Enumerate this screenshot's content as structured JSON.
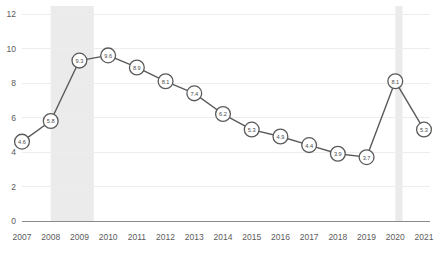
{
  "chart_data": {
    "type": "line",
    "title": "",
    "subtitle": "",
    "xlabel": "",
    "ylabel": "",
    "categories": [
      "2007",
      "2008",
      "2009",
      "2010",
      "2011",
      "2012",
      "2013",
      "2014",
      "2015",
      "2016",
      "2017",
      "2018",
      "2019",
      "2020",
      "2021"
    ],
    "values": [
      4.6,
      5.8,
      9.3,
      9.6,
      8.9,
      8.1,
      7.4,
      6.2,
      5.3,
      4.9,
      4.4,
      3.9,
      3.7,
      8.1,
      5.3
    ],
    "point_labels": [
      "4.6",
      "5.8",
      "9.3",
      "9.6",
      "8.9",
      "8.1",
      "7.4",
      "6.2",
      "5.3",
      "4.9",
      "4.4",
      "3.9",
      "3.7",
      "8.1",
      "5.3"
    ],
    "series": [
      {
        "name": "",
        "values": [
          4.6,
          5.8,
          9.3,
          9.6,
          8.9,
          8.1,
          7.4,
          6.2,
          5.3,
          4.9,
          4.4,
          3.9,
          3.7,
          8.1,
          5.3
        ]
      }
    ],
    "ylim": [
      0,
      12
    ],
    "yticks": [
      0,
      2,
      4,
      6,
      8,
      10,
      12
    ],
    "ytick_labels": [
      "0",
      "2",
      "4",
      "6",
      "8",
      "10",
      "12"
    ],
    "xtick_labels": [
      "2007",
      "2008",
      "2009",
      "2010",
      "2011",
      "2012",
      "2013",
      "2014",
      "2015",
      "2016",
      "2017",
      "2018",
      "2019",
      "2020",
      "2021"
    ],
    "grid": true,
    "grid_axis": "y",
    "legend": false,
    "legend_position": "none",
    "annotations": [
      {
        "name": "recession-band-2008",
        "type": "vspan",
        "x_start": 2008.0,
        "x_end": 2009.5
      },
      {
        "name": "recession-band-2020",
        "type": "vspan",
        "x_start": 2020.0,
        "x_end": 2020.25
      }
    ],
    "colors": {
      "line": "#5a5a5a",
      "marker_fill": "#ffffff",
      "marker_stroke": "#5a5a5a",
      "grid": "#ededed",
      "axis": "#8a8a8a",
      "band": "#ebebeb",
      "tick_text": "#5b5b5b",
      "label_text": "#4a4a4a",
      "background": "#ffffff"
    }
  }
}
